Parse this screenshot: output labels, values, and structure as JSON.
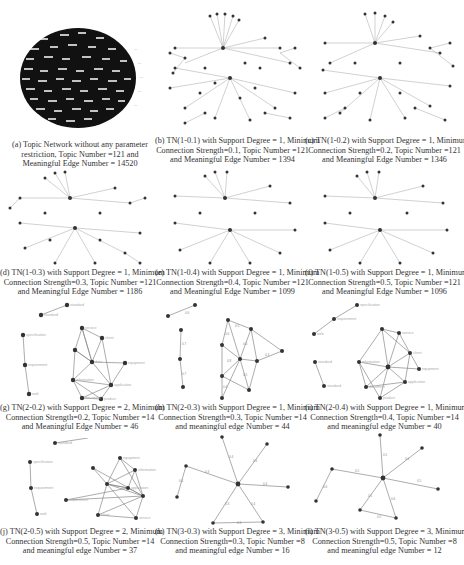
{
  "figure": {
    "top_text_fragment": "...(partial body text cut off at top of page)",
    "panels": [
      {
        "id": "a",
        "caption_lines": [
          "(a) Topic Network without any parameter",
          "restriction, Topic Number =121  and",
          "Meaningful Edge Number = 14520"
        ],
        "support_degree": null,
        "min_connection_strength": null,
        "topic_number": 121,
        "edge_number": 14520
      },
      {
        "id": "b",
        "caption_lines": [
          "(b) TN(1-0.1) with Support Degree = 1, Minimum",
          "Connection Strength=0.1, Topic Number =121",
          "and Meaningful Edge Number = 1394"
        ],
        "support_degree": 1,
        "min_connection_strength": 0.1,
        "topic_number": 121,
        "edge_number": 1394
      },
      {
        "id": "c",
        "caption_lines": [
          "(c) TN(1-0.2) with Support Degree = 1, Minimum",
          "Connection Strength=0.2, Topic Number =121",
          "and Meaningful Edge Number = 1346"
        ],
        "support_degree": 1,
        "min_connection_strength": 0.2,
        "topic_number": 121,
        "edge_number": 1346
      },
      {
        "id": "d",
        "caption_lines": [
          "(d) TN(1-0.3) with Support Degree = 1, Minimum",
          "Connection Strength=0.3, Topic Number =121",
          "and Meaningful Edge Number = 1186"
        ],
        "support_degree": 1,
        "min_connection_strength": 0.3,
        "topic_number": 121,
        "edge_number": 1186
      },
      {
        "id": "e",
        "caption_lines": [
          "(e) TN(1-0.4) with Support Degree = 1, Minimum",
          "Connection Strength=0.4, Topic Number =121",
          "and Meaningful Edge Number = 1099"
        ],
        "support_degree": 1,
        "min_connection_strength": 0.4,
        "topic_number": 121,
        "edge_number": 1099
      },
      {
        "id": "f",
        "caption_lines": [
          "(f) TN(1-0.5) with Support Degree = 1, Minimum",
          "Connection Strength=0.5, Topic Number =121",
          "and Meaningful Edge Number = 1096"
        ],
        "support_degree": 1,
        "min_connection_strength": 0.5,
        "topic_number": 121,
        "edge_number": 1096
      },
      {
        "id": "g",
        "caption_lines": [
          "(g) TN(2-0.2) with Support Degree = 2, Minimum",
          "Connection Strength=0.2, Topic Number =14",
          "and Meaningful Edge Number = 46"
        ],
        "support_degree": 2,
        "min_connection_strength": 0.2,
        "topic_number": 14,
        "edge_number": 46
      },
      {
        "id": "h",
        "caption_lines": [
          "(h) TN(2-0.3) with Support Degree = 1, Minimum",
          "Connection Strength=0.3, Topic Number =14",
          "and meaningful edge Number = 44"
        ],
        "support_degree": 1,
        "min_connection_strength": 0.3,
        "topic_number": 14,
        "edge_number": 44
      },
      {
        "id": "i",
        "caption_lines": [
          "(i) TN(2-0.4) with Support Degree = 1, Minimum",
          "Connection Strength=0.4, Topic Number =14",
          "and meaningful edge Number = 40"
        ],
        "support_degree": 1,
        "min_connection_strength": 0.4,
        "topic_number": 14,
        "edge_number": 40
      },
      {
        "id": "j",
        "caption_lines": [
          "(j) TN(2-0.5) with Support Degree = 2, Minimum",
          "Connection Strength=0.5, Topic Number =14",
          "and meaningful edge Number = 37"
        ],
        "support_degree": 2,
        "min_connection_strength": 0.5,
        "topic_number": 14,
        "edge_number": 37
      },
      {
        "id": "k",
        "caption_lines": [
          "(k) TN(3-0.3) with Support Degree = 3, Minimum",
          "Connection Strength=0.3, Topic Number =8",
          "and meaningful edge Number = 16"
        ],
        "support_degree": 3,
        "min_connection_strength": 0.3,
        "topic_number": 8,
        "edge_number": 16
      },
      {
        "id": "l",
        "caption_lines": [
          "(l) TN(3-0.5) with Support Degree = 3, Minimum",
          "Connection Strength=0.5, Topic Number =8",
          "and meaningful edge Number = 12"
        ],
        "support_degree": 3,
        "min_connection_strength": 0.5,
        "topic_number": 8,
        "edge_number": 12
      }
    ],
    "node_labels_visible": [
      "standard",
      "standard",
      "specification",
      "requirement",
      "web",
      "service",
      "client",
      "data",
      "information",
      "application",
      "requirement",
      "equipment",
      "product",
      "document"
    ],
    "colors": {
      "node": "#333333",
      "edge": "#888888",
      "label": "#aaaaaa",
      "caption": "#333333"
    }
  }
}
